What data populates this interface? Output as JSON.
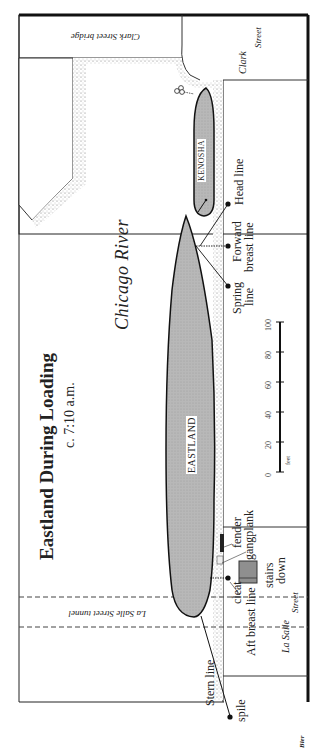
{
  "title": "Eastland During Loading",
  "subtitle": "c. 7:10 a.m.",
  "river_label": "Chicago River",
  "streets": {
    "clark_street_bridge": "Clark Street bridge",
    "clark_street_line1": "Clark",
    "clark_street_line2": "Street",
    "la_salle_street_tunnel": "La Salle Street tunnel",
    "la_salle_street_line1": "La Salle",
    "la_salle_street_line2": "Street"
  },
  "ships": [
    {
      "name": "EASTLAND"
    },
    {
      "name": "KENOSHA"
    }
  ],
  "lines": {
    "head_line": "Head line",
    "forward_breast_line_1": "Forward",
    "forward_breast_line_2": "breast line",
    "spring_line_1": "Spring",
    "spring_line_2": "line",
    "aft_breast_line": "Aft breast line",
    "stern_line": "Stern line"
  },
  "fixtures": {
    "fender": "fender",
    "gangplank": "gangplank",
    "cleat": "cleat",
    "stairs_down_1": "stairs",
    "stairs_down_2": "down",
    "spile": "spile"
  },
  "scale": {
    "unit": "feet",
    "ticks": [
      "0",
      "20",
      "40",
      "60",
      "80",
      "100"
    ]
  },
  "signature": "Bier",
  "colors": {
    "ship_fill": "#b5b5b5",
    "outline": "#111111",
    "stipple": "#8a8a8a",
    "stairs_fill": "#8f8f8f"
  }
}
